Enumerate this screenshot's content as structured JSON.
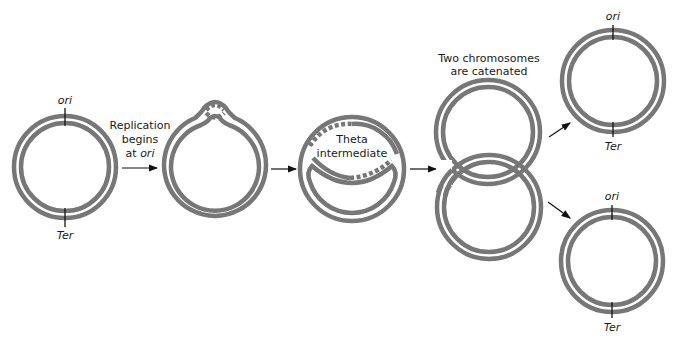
{
  "diagram": {
    "labels": {
      "ori": "ori",
      "ter": "Ter",
      "step1_line1": "Replication",
      "step1_line2": "begins",
      "step1_line3_prefix": "at ",
      "step1_line3_italic": "ori",
      "theta_line1": "Theta",
      "theta_line2": "intermediate",
      "catenated_line1": "Two chromosomes",
      "catenated_line2": "are catenated"
    },
    "stages": [
      {
        "id": "circular-chromosome",
        "description": "Double-stranded circular chromosome with ori and Ter marked"
      },
      {
        "id": "replication-bubble",
        "description": "Replication bubble forms at ori"
      },
      {
        "id": "theta-intermediate",
        "description": "Theta intermediate with newly synthesized (dashed) strands"
      },
      {
        "id": "catenated-chromosomes",
        "description": "Two interlinked daughter chromosomes"
      },
      {
        "id": "separated-chromosomes",
        "description": "Two separated daughter chromosomes, each with ori and Ter"
      }
    ],
    "colors": {
      "dna_strand": "#777777",
      "tick": "#111111",
      "text": "#1a1a1a",
      "background": "#ffffff"
    }
  }
}
